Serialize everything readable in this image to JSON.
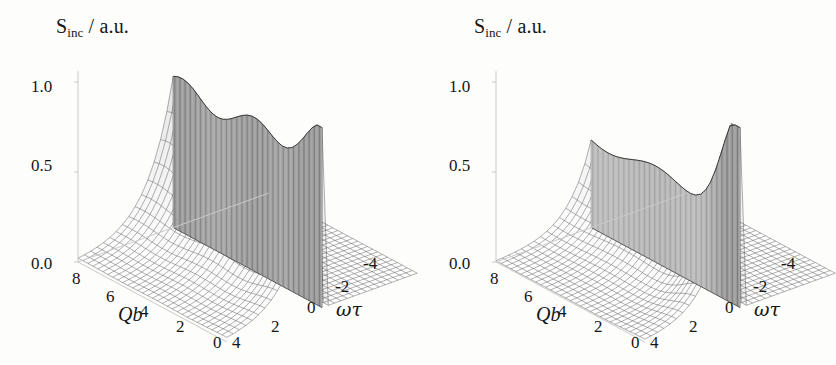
{
  "figure": {
    "background": "#fdfdfc",
    "ink": "#151515",
    "mesh_color": "#555555",
    "axis_color": "#c9c9c9",
    "panel_count": 2
  },
  "panels": [
    {
      "id": "left",
      "title": "S_inc / a.u.",
      "title_main": "S",
      "title_sub": "inc",
      "title_tail": " / a.u.",
      "z_axis": {
        "label": "S_inc / a.u.",
        "ticks": [
          "0.0",
          "0.5",
          "1.0"
        ],
        "values": [
          0.0,
          0.5,
          1.0
        ],
        "range": [
          0.0,
          1.0
        ]
      },
      "x_axis": {
        "name": "Qb",
        "ticks": [
          "8",
          "6",
          "4",
          "2",
          "0"
        ],
        "values": [
          8,
          6,
          4,
          2,
          0
        ],
        "range": [
          0,
          8
        ]
      },
      "y_axis": {
        "name": "ωτ",
        "ticks": [
          "4",
          "2",
          "0",
          "-2",
          "-4"
        ],
        "values": [
          4,
          2,
          0,
          -2,
          -4
        ],
        "range": [
          -4,
          4
        ]
      },
      "surface": {
        "description": "oscillating crest with three lobes along Qb, sharp vertical cliff at omega-tau = 0, flat zero plateau for omega-tau < 0",
        "crest_height": 0.82,
        "max_height": 0.97,
        "oscillation_lobes": 3,
        "cliff_at": 0
      }
    },
    {
      "id": "right",
      "title": "S_inc / a.u.",
      "title_main": "S",
      "title_sub": "inc",
      "title_tail": " / a.u.",
      "z_axis": {
        "label": "S_inc / a.u.",
        "ticks": [
          "0.0",
          "0.5",
          "1.0"
        ],
        "values": [
          0.0,
          0.5,
          1.0
        ],
        "range": [
          0.0,
          1.0
        ]
      },
      "x_axis": {
        "name": "Qb",
        "ticks": [
          "8",
          "6",
          "4",
          "2",
          "0"
        ],
        "values": [
          8,
          6,
          4,
          2,
          0
        ],
        "range": [
          0,
          8
        ]
      },
      "y_axis": {
        "name": "ωτ",
        "ticks": [
          "4",
          "2",
          "0",
          "-2",
          "-4"
        ],
        "values": [
          4,
          2,
          0,
          -2,
          -4
        ],
        "range": [
          -4,
          4
        ]
      },
      "surface": {
        "description": "broad shoulder near large Qb rising to a single tall narrow peak adjacent to omega-tau = 0, sharp vertical cliff at omega-tau = 0, flat zero plateau for omega-tau < 0",
        "crest_height": 0.55,
        "max_height": 0.97,
        "oscillation_lobes": 1,
        "cliff_at": 0
      }
    }
  ],
  "chart_data": {
    "type": "surface",
    "xlabel": "Qb",
    "ylabel": "ωτ",
    "zlabel": "S_inc / a.u.",
    "xlim": [
      0,
      8
    ],
    "ylim": [
      -4,
      4
    ],
    "zlim": [
      0,
      1
    ],
    "xticks": [
      8,
      6,
      4,
      2,
      0
    ],
    "yticks": [
      4,
      2,
      0,
      -2,
      -4
    ],
    "zticks": [
      0.0,
      0.5,
      1.0
    ],
    "grid": false,
    "legend": "none",
    "projection": "3d-mesh",
    "panels": [
      {
        "name": "left",
        "model": "oscillatory",
        "note": "S_inc(Qb, wt) = 0 for wt < 0; for wt >= 0 an exponentially rising ridge toward wt=0 modulated by an oscillation in Qb producing three crest lobes",
        "crest_profile_qb": [
          8,
          7,
          6,
          5,
          4,
          3,
          2,
          1,
          0
        ],
        "crest_profile_values": [
          0.8,
          0.74,
          0.8,
          0.78,
          0.7,
          0.79,
          0.76,
          0.88,
          0.97
        ],
        "ridge_decay_wt": [
          0,
          0.5,
          1,
          1.5,
          2,
          2.5,
          3,
          3.5,
          4
        ],
        "ridge_decay_values": [
          1.0,
          0.62,
          0.36,
          0.21,
          0.12,
          0.07,
          0.04,
          0.02,
          0.01
        ]
      },
      {
        "name": "right",
        "model": "single-peak",
        "note": "S_inc(Qb, wt) = 0 for wt < 0; for wt >= 0 a broad shoulder at large Qb that sharpens into one tall narrow peak adjacent to wt = 0",
        "crest_profile_qb": [
          8,
          7,
          6,
          5,
          4,
          3,
          2,
          1,
          0
        ],
        "crest_profile_values": [
          0.55,
          0.53,
          0.5,
          0.47,
          0.48,
          0.44,
          0.52,
          0.75,
          0.97
        ],
        "ridge_decay_wt": [
          0,
          0.5,
          1,
          1.5,
          2,
          2.5,
          3,
          3.5,
          4
        ],
        "ridge_decay_values": [
          1.0,
          0.55,
          0.3,
          0.17,
          0.1,
          0.06,
          0.03,
          0.02,
          0.01
        ]
      }
    ]
  }
}
